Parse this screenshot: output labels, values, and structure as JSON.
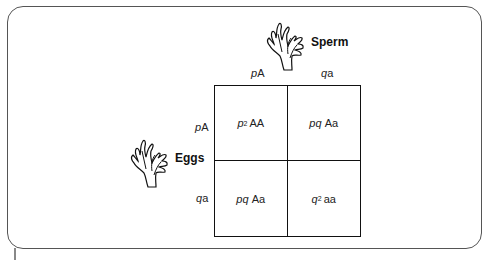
{
  "diagram": {
    "type": "punnett-square",
    "sperm": {
      "label": "Sperm",
      "icon": "coral-icon"
    },
    "eggs": {
      "label": "Eggs",
      "icon": "coral-icon"
    },
    "columns": [
      {
        "freq": "p",
        "allele": "A"
      },
      {
        "freq": "q",
        "allele": "a"
      }
    ],
    "rows": [
      {
        "freq": "p",
        "allele": "A"
      },
      {
        "freq": "q",
        "allele": "a"
      }
    ],
    "cells": [
      [
        {
          "freq": "p",
          "sup": "2",
          "genotype": "AA"
        },
        {
          "freq": "pq",
          "sup": "",
          "genotype": "Aa"
        }
      ],
      [
        {
          "freq": "pq",
          "sup": "",
          "genotype": "Aa"
        },
        {
          "freq": "q",
          "sup": "2",
          "genotype": "aa"
        }
      ]
    ]
  }
}
